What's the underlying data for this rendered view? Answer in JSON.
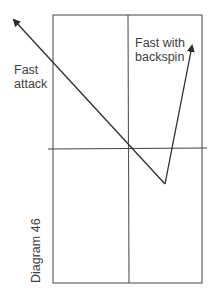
{
  "diagram": {
    "caption": "Diagram 46",
    "labels": {
      "fast_attack": [
        "Fast",
        "attack"
      ],
      "fast_with_backspin": [
        "Fast with",
        "backspin"
      ]
    },
    "colors": {
      "stroke": "#3a3a3a",
      "text": "#404040",
      "background": "#ffffff"
    },
    "court": {
      "left": 53,
      "right": 202,
      "top": 15,
      "bottom": 283,
      "center_x": 128
    },
    "net_line": {
      "y": 149,
      "x1": 48,
      "x2": 207
    },
    "trajectories": [
      {
        "name": "fast-attack",
        "from": [
          165,
          184
        ],
        "to": [
          12,
          18
        ],
        "arrow": true
      },
      {
        "name": "fast-with-backspin",
        "bounce": [
          165,
          184
        ],
        "to": [
          193,
          43
        ],
        "arrow": true
      }
    ]
  }
}
